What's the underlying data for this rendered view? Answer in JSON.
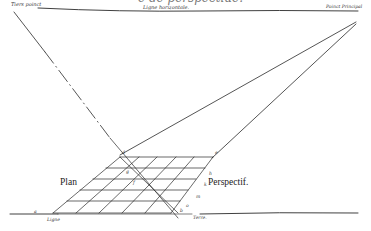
{
  "title_fragment": "e de perspectiue.",
  "labels": {
    "tiers_point": "Tiers poinct",
    "ligne_horizontale": "Ligne horizontale.",
    "point_principal": "Poinct Principal",
    "plan": "Plan",
    "perspectif": "Perspectif.",
    "ligne": "Ligne",
    "terre": "Terre."
  },
  "point_letters": {
    "a": "a",
    "b": "b",
    "d": "d",
    "g": "g",
    "f": "f",
    "e": "e",
    "h": "h",
    "k": "k",
    "m": "m",
    "o": "o"
  },
  "colors": {
    "ink": "#2a2a2a",
    "paper": "#ffffff"
  }
}
